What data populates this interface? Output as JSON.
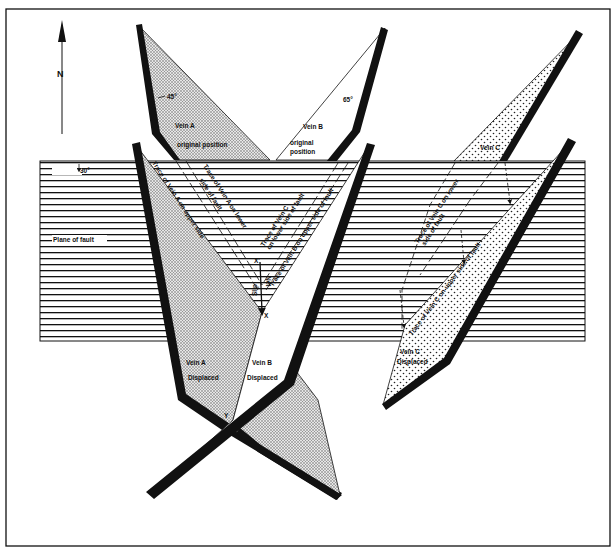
{
  "figure": {
    "north_label": "N",
    "fault_plane_label": "Plane of fault",
    "fault_dip": "30°",
    "veins": [
      {
        "id": "A",
        "original_label": "Vein A",
        "original_sublabel": "original position",
        "dip": "45°",
        "displaced_label": "Vein A",
        "displaced_sublabel": "Displaced",
        "fill": "stippled-dense"
      },
      {
        "id": "B",
        "original_label": "Vein B",
        "original_sublabel_1": "original",
        "original_sublabel_2": "position",
        "dip": "65°",
        "displaced_label": "Vein B",
        "displaced_sublabel": "Displaced",
        "fill": "plain"
      },
      {
        "id": "C",
        "original_label": "Vein C",
        "displaced_label": "Vein C",
        "displaced_sublabel": "Displaced",
        "fill": "dotted"
      }
    ],
    "traces": {
      "a_upper": "Trace of Vein A on upper side",
      "a_lower_1": "Trace of Vein A on lower",
      "a_lower_2": "side of fault",
      "c_lower_mid_1": "Trace of Vein C",
      "c_lower_mid_2": "on lower side of fault",
      "b_upper": "Trace of Vein B on upper side of fault",
      "c_lower_right_1": "Trace of Vein C on lower",
      "c_lower_right_2": "side of fault",
      "c_upper_right": "Trace of Vein C on upper side of fault"
    },
    "points": {
      "x": "X",
      "x_prime": "X'",
      "y": "Y"
    },
    "net_slip": {
      "word1": "Slip",
      "word2": "Net"
    }
  }
}
